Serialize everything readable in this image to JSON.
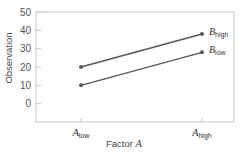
{
  "chart_data": {
    "type": "line",
    "title": "",
    "xlabel": "Factor A",
    "xlabel_parts": {
      "text": "Factor ",
      "var": "A"
    },
    "ylabel": "Observation",
    "categories": [
      {
        "var": "A",
        "sub": "low"
      },
      {
        "var": "A",
        "sub": "high"
      }
    ],
    "category_labels": [
      "A_low",
      "A_high"
    ],
    "ylim": [
      -10,
      50
    ],
    "yticks": [
      0,
      10,
      20,
      30,
      40,
      50
    ],
    "grid": false,
    "legend": "inline-right",
    "series": [
      {
        "name": "B_high",
        "var": "B",
        "sub": "high",
        "values": [
          20,
          38
        ]
      },
      {
        "name": "B_low",
        "var": "B",
        "sub": "low",
        "values": [
          10,
          28
        ]
      }
    ]
  },
  "colors": {
    "line": "#555555",
    "marker": "#555555",
    "frame": "#c8c8c8",
    "tick": "#c8c8c8",
    "text": "#555555"
  }
}
